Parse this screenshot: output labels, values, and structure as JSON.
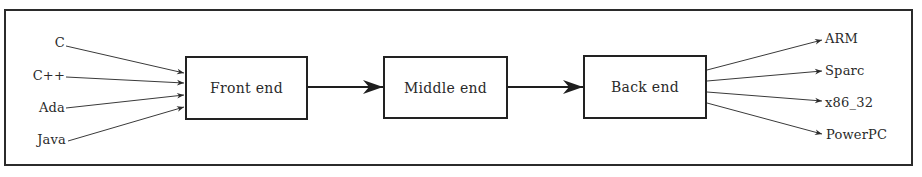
{
  "diagram": {
    "type": "compiler-pipeline",
    "stages": [
      {
        "id": "front",
        "label": "Front end"
      },
      {
        "id": "middle",
        "label": "Middle end"
      },
      {
        "id": "back",
        "label": "Back end"
      }
    ],
    "inputs": [
      {
        "label": "C"
      },
      {
        "label": "C++"
      },
      {
        "label": "Ada"
      },
      {
        "label": "Java"
      }
    ],
    "outputs": [
      {
        "label": "ARM"
      },
      {
        "label": "Sparc"
      },
      {
        "label": "x86_32"
      },
      {
        "label": "PowerPC"
      }
    ],
    "edges": [
      {
        "from": "C",
        "to": "Front end"
      },
      {
        "from": "C++",
        "to": "Front end"
      },
      {
        "from": "Ada",
        "to": "Front end"
      },
      {
        "from": "Java",
        "to": "Front end"
      },
      {
        "from": "Front end",
        "to": "Middle end"
      },
      {
        "from": "Middle end",
        "to": "Back end"
      },
      {
        "from": "Back end",
        "to": "ARM"
      },
      {
        "from": "Back end",
        "to": "Sparc"
      },
      {
        "from": "Back end",
        "to": "x86_32"
      },
      {
        "from": "Back end",
        "to": "PowerPC"
      }
    ],
    "colors": {
      "line": "#2b2b2b",
      "background": "#ffffff"
    }
  }
}
